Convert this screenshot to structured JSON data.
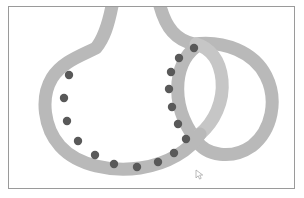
{
  "scene": {
    "title": "Knot diagram with two interlocking loops",
    "width": 304,
    "height": 198,
    "background_color": "#ffffff"
  },
  "frame": {
    "name": "image-border",
    "border_color": "#9a9a9a",
    "border_width": 1,
    "x": 8,
    "y": 6,
    "width": 287,
    "height": 183
  },
  "figure": {
    "band_color": "#b9b9b9",
    "band_color_shadow": "#c6c6c6",
    "band_width": 13,
    "dot_color": "#595959",
    "dot_radius": 4.2,
    "dot_count": 16
  },
  "paths": {
    "left_loop": "M 112 6 C 108 26, 104 38, 96 48 C 80 56, 62 62, 52 78 C 40 98, 44 128, 60 146 C 78 166, 112 172, 140 168 C 168 164, 190 150, 200 134",
    "right_loop_outer": "M 160 6 C 166 28, 176 40, 194 44 C 224 40, 254 52, 266 76 C 278 100, 272 130, 252 146 C 232 160, 206 156, 196 140",
    "right_loop_inner": "M 196 140 C 184 124, 176 104, 178 82 C 180 62, 190 50, 200 44",
    "crossing_band": "M 200 134 C 214 122, 224 102, 222 80 C 220 60, 210 48, 196 44"
  },
  "dots": [
    {
      "id": "dot-1",
      "cx": 69,
      "cy": 75,
      "arc": "left-loop"
    },
    {
      "id": "dot-2",
      "cx": 64,
      "cy": 98,
      "arc": "left-loop"
    },
    {
      "id": "dot-3",
      "cx": 67,
      "cy": 121,
      "arc": "left-loop"
    },
    {
      "id": "dot-4",
      "cx": 78,
      "cy": 141,
      "arc": "left-loop"
    },
    {
      "id": "dot-5",
      "cx": 95,
      "cy": 155,
      "arc": "left-loop"
    },
    {
      "id": "dot-6",
      "cx": 114,
      "cy": 164,
      "arc": "left-loop"
    },
    {
      "id": "dot-7",
      "cx": 137,
      "cy": 167,
      "arc": "left-loop"
    },
    {
      "id": "dot-8",
      "cx": 158,
      "cy": 162,
      "arc": "left-loop"
    },
    {
      "id": "dot-9",
      "cx": 174,
      "cy": 153,
      "arc": "left-loop"
    },
    {
      "id": "dot-10",
      "cx": 186,
      "cy": 139,
      "arc": "left-loop"
    },
    {
      "id": "dot-11",
      "cx": 178,
      "cy": 124,
      "arc": "right-arc"
    },
    {
      "id": "dot-12",
      "cx": 172,
      "cy": 107,
      "arc": "right-arc"
    },
    {
      "id": "dot-13",
      "cx": 169,
      "cy": 89,
      "arc": "right-arc"
    },
    {
      "id": "dot-14",
      "cx": 171,
      "cy": 72,
      "arc": "right-arc"
    },
    {
      "id": "dot-15",
      "cx": 179,
      "cy": 58,
      "arc": "right-arc"
    },
    {
      "id": "dot-16",
      "cx": 194,
      "cy": 48,
      "arc": "right-arc"
    }
  ],
  "cursor": {
    "name": "mouse-cursor",
    "x": 196,
    "y": 170,
    "color": "#9d9d9d"
  }
}
